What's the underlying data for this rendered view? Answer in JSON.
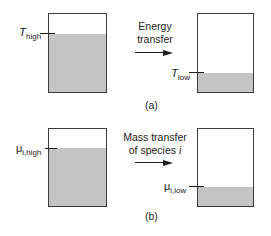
{
  "panel_a": {
    "arrow_line1": "Energy",
    "arrow_line2": "transfer",
    "left_label_main": "T",
    "left_label_sub": "high",
    "right_label_main": "T",
    "right_label_sub": "low",
    "caption": "(a)",
    "left_fill_fraction": 0.74,
    "right_fill_fraction": 0.25
  },
  "panel_b": {
    "arrow_line1": "Mass transfer",
    "arrow_line2_prefix": "of species ",
    "arrow_line2_italic": "i",
    "left_label_main": "μ",
    "left_label_sub": "i,high",
    "right_label_main": "μ",
    "right_label_sub": "i,low",
    "caption": "(b)",
    "left_fill_fraction": 0.74,
    "right_fill_fraction": 0.25
  },
  "colors": {
    "fill": "#c4c4c4",
    "outline": "#3a3a3a",
    "line": "#1e1e1e"
  }
}
